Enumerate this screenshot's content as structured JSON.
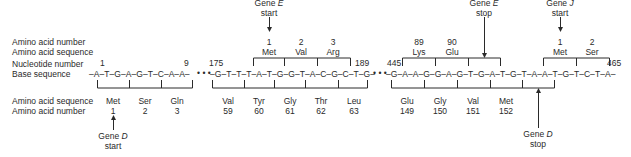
{
  "row_labels_top": {
    "aa_number": "Amino acid number",
    "aa_sequence": "Amino acid sequence",
    "nt_number": "Nucleotide number",
    "base_sequence": "Base sequence"
  },
  "row_labels_bottom": {
    "aa_sequence": "Amino acid sequence",
    "aa_number": "Amino acid number"
  },
  "segments": [
    {
      "sequence": "–A–T–G–A–G–T–C–A–A–",
      "start_nt": "1",
      "end_nt": "9"
    },
    {
      "sequence": "–G–T–T–T–A–T–G–G–T–A–C–G–C–T–G–",
      "start_nt": "175",
      "end_nt": "189"
    },
    {
      "sequence": "–G–A–A–G–G–A–G–T–G–A–T–G–T–A–A–T–G–T–C–T–A–",
      "start_nt": "445",
      "end_nt": "465"
    }
  ],
  "ellipsis": "• • •",
  "gene_d_codons": [
    {
      "aa": "Met",
      "num": "1"
    },
    {
      "aa": "Ser",
      "num": "2"
    },
    {
      "aa": "Gln",
      "num": "3"
    },
    {
      "aa": "Val",
      "num": "59"
    },
    {
      "aa": "Tyr",
      "num": "60"
    },
    {
      "aa": "Gly",
      "num": "61"
    },
    {
      "aa": "Thr",
      "num": "62"
    },
    {
      "aa": "Leu",
      "num": "63"
    },
    {
      "aa": "Glu",
      "num": "149"
    },
    {
      "aa": "Gly",
      "num": "150"
    },
    {
      "aa": "Val",
      "num": "151"
    },
    {
      "aa": "Met",
      "num": "152"
    }
  ],
  "gene_e_codons": [
    {
      "aa": "Met",
      "num": "1"
    },
    {
      "aa": "Val",
      "num": "2"
    },
    {
      "aa": "Arg",
      "num": "3"
    },
    {
      "aa": "Lys",
      "num": "89"
    },
    {
      "aa": "Glu",
      "num": "90"
    }
  ],
  "gene_j_codons": [
    {
      "aa": "Met",
      "num": "1"
    },
    {
      "aa": "Ser",
      "num": "2"
    }
  ],
  "annotations": {
    "gene_d_start": {
      "word": "Gene",
      "gene": "D",
      "event": "start"
    },
    "gene_d_stop": {
      "word": "Gene",
      "gene": "D",
      "event": "stop"
    },
    "gene_e_start": {
      "word": "Gene",
      "gene": "E",
      "event": "start"
    },
    "gene_e_stop": {
      "word": "Gene",
      "gene": "E",
      "event": "stop"
    },
    "gene_j_start": {
      "word": "Gene",
      "gene": "J",
      "event": "start"
    }
  }
}
